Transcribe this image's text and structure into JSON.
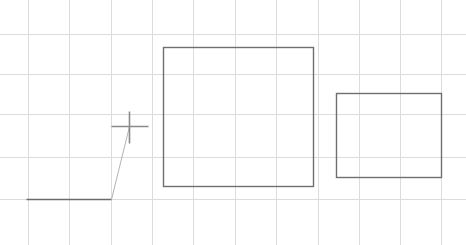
{
  "app": {
    "title": "Drawing Canvas",
    "width": 466,
    "height": 245,
    "background_color": "#ffffff"
  },
  "grid": {
    "name": "background-grid",
    "color": "#dcdcdc",
    "line_width": 1,
    "vertical_x": [
      28,
      69,
      111,
      152,
      193,
      235,
      276,
      318,
      359,
      400,
      441
    ],
    "horizontal_y": [
      34,
      74,
      114,
      157,
      199
    ],
    "spacing_x": 41,
    "spacing_y": 41
  },
  "shapes": [
    {
      "name": "large-rectangle",
      "type": "rectangle",
      "x": 163,
      "y": 47,
      "width": 150,
      "height": 139,
      "stroke_color": "#6f6f6f",
      "stroke_width": 1.4,
      "fill": "none"
    },
    {
      "name": "small-rectangle",
      "type": "rectangle",
      "x": 336,
      "y": 93,
      "width": 105,
      "height": 84,
      "stroke_color": "#6f6f6f",
      "stroke_width": 1.4,
      "fill": "none"
    },
    {
      "name": "baseline-segment",
      "type": "line",
      "x1": 26,
      "y1": 199,
      "x2": 111,
      "y2": 199,
      "stroke_color": "#6b6b6b",
      "stroke_width": 1.3
    },
    {
      "name": "rubber-band-segment",
      "type": "line",
      "x1": 111,
      "y1": 199,
      "x2": 129,
      "y2": 126,
      "stroke_color": "#b3b3b3",
      "stroke_width": 1
    }
  ],
  "cursor": {
    "name": "crosshair-cursor",
    "center_x": 129,
    "center_y": 126,
    "horizontal_x1": 111,
    "horizontal_x2": 148,
    "vertical_y1": 111,
    "vertical_y2": 143,
    "stroke_color": "#8a8a8a",
    "stroke_width": 1.6
  }
}
